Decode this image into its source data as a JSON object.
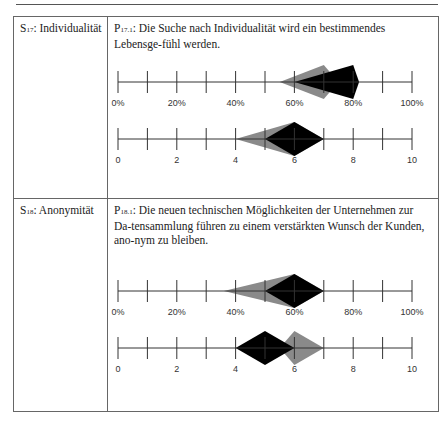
{
  "row1": {
    "label_prefix": "S",
    "label_sub": "17",
    "label_text": ": Individualität",
    "stmt_prefix": "P",
    "stmt_sub": "17.1",
    "stmt_text": ": Die Suche nach Individualität wird ein bestimmendes Lebensge-fühl werden."
  },
  "row2": {
    "label_prefix": "S",
    "label_sub": "18",
    "label_text": ": Anonymität",
    "stmt_prefix": "P",
    "stmt_sub": "18.1",
    "stmt_text": ": Die neuen technischen Möglichkeiten der Unternehmen zur Da-tensammlung führen zu einem verstärkten Wunsch der Kunden, ano-nym zu bleiben."
  },
  "axis_labels": {
    "percent": [
      "0%",
      "20%",
      "40%",
      "60%",
      "80%",
      "100%"
    ],
    "scale": [
      "0",
      "2",
      "4",
      "6",
      "8",
      "10"
    ]
  },
  "colors": {
    "gray": "#8a8a8a",
    "black": "#000000",
    "axis": "#333333"
  },
  "chart_data": [
    {
      "type": "range-diamond",
      "title": "P17.1 probability",
      "axis": "percent",
      "xlim": [
        0,
        100
      ],
      "series": [
        {
          "name": "round 1 (gray)",
          "left": 55,
          "peak": 70,
          "right": 75
        },
        {
          "name": "round 2 (black)",
          "left": 60,
          "peak": 80,
          "right": 82
        }
      ]
    },
    {
      "type": "range-diamond",
      "title": "P17.1 impact",
      "axis": "scale",
      "xlim": [
        0,
        10
      ],
      "series": [
        {
          "name": "round 1 (gray)",
          "left": 4,
          "peak": 6,
          "right": 7
        },
        {
          "name": "round 2 (black)",
          "left": 5,
          "peak": 6,
          "right": 7
        }
      ]
    },
    {
      "type": "range-diamond",
      "title": "P18.1 probability",
      "axis": "percent",
      "xlim": [
        0,
        100
      ],
      "series": [
        {
          "name": "round 1 (gray)",
          "left": 36,
          "peak": 60,
          "right": 70
        },
        {
          "name": "round 2 (black)",
          "left": 50,
          "peak": 60,
          "right": 70
        }
      ]
    },
    {
      "type": "range-diamond",
      "title": "P18.1 impact",
      "axis": "scale",
      "xlim": [
        0,
        10
      ],
      "series": [
        {
          "name": "round 1 (gray)",
          "left": 5.5,
          "peak": 6,
          "right": 7
        },
        {
          "name": "round 2 (black)",
          "left": 4,
          "peak": 5,
          "right": 6
        }
      ]
    }
  ]
}
